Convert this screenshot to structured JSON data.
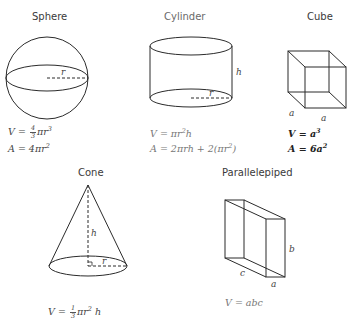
{
  "shapes": {
    "sphere": {
      "title": "Sphere",
      "radius_label": "r",
      "volume": {
        "prefix": "V = ",
        "frac_num": "4",
        "frac_den": "3",
        "suffix": "πr",
        "exp": "3"
      },
      "area": {
        "prefix": "A = 4πr",
        "exp": "2"
      }
    },
    "cylinder": {
      "title": "Cylinder",
      "height_label": "h",
      "radius_label": "r",
      "volume": {
        "prefix": "V = πr",
        "exp": "2",
        "suffix": "h"
      },
      "area": {
        "prefix": "A = 2πrh + 2(πr",
        "exp": "2",
        "suffix": ")"
      }
    },
    "cube": {
      "title": "Cube",
      "edge_label_left": "a",
      "edge_label_bottom": "a",
      "volume": {
        "prefix": "V = a",
        "exp": "3"
      },
      "area": {
        "prefix": "A = 6a",
        "exp": "2"
      }
    },
    "cone": {
      "title": "Cone",
      "height_label": "h",
      "radius_label": "r",
      "volume": {
        "prefix": "V = ",
        "frac_num": "1",
        "frac_den": "3",
        "suffix": "πr",
        "exp": "2",
        "suffix2": " h"
      }
    },
    "parallelepiped": {
      "title": "Parallelepiped",
      "label_a": "a",
      "label_b": "b",
      "label_c": "c",
      "volume": {
        "text": "V = abc"
      }
    }
  },
  "colors": {
    "stroke": "#2b2b2b",
    "text": "#3a3a3a",
    "background": "#ffffff"
  }
}
